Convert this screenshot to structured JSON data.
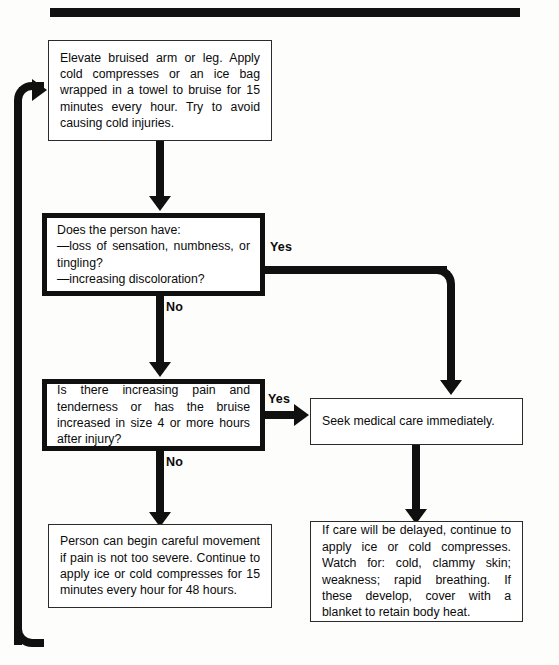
{
  "page": {
    "ink_color": "#101010",
    "paper_color": "#fdfdfc"
  },
  "nodes": {
    "treatment_start": {
      "id": "treatment-start",
      "shape": "process",
      "text": "Elevate bruised arm or leg. Apply cold compresses or an ice bag wrapped in a towel to bruise for 15 minutes every hour. Try to avoid causing cold injuries."
    },
    "decision_sensation": {
      "id": "decision-sensation",
      "shape": "decision",
      "text": "Does the person have:\n—loss of sensation, numbness, or tingling?\n—increasing discoloration?"
    },
    "decision_pain": {
      "id": "decision-pain",
      "shape": "decision",
      "text": "Is there increasing pain and tenderness or has the bruise increased in size 4 or more hours after injury?"
    },
    "outcome_self_care": {
      "id": "outcome-self-care",
      "shape": "process",
      "text": "Person can begin careful movement if pain is not too severe. Continue to apply ice or cold compresses for 15 minutes every hour for 48 hours."
    },
    "outcome_seek_care": {
      "id": "outcome-seek-care",
      "shape": "process",
      "text": "Seek medical care immediately."
    },
    "outcome_delayed_care": {
      "id": "outcome-delayed-care",
      "shape": "process",
      "text": "If care will be delayed, continue to apply ice or cold compresses. Watch for: cold, clammy skin; weakness; rapid breathing. If these develop, cover with a blanket to retain body heat."
    }
  },
  "branch_labels": {
    "sensation_yes": "Yes",
    "sensation_no": "No",
    "pain_yes": "Yes",
    "pain_no": "No"
  }
}
